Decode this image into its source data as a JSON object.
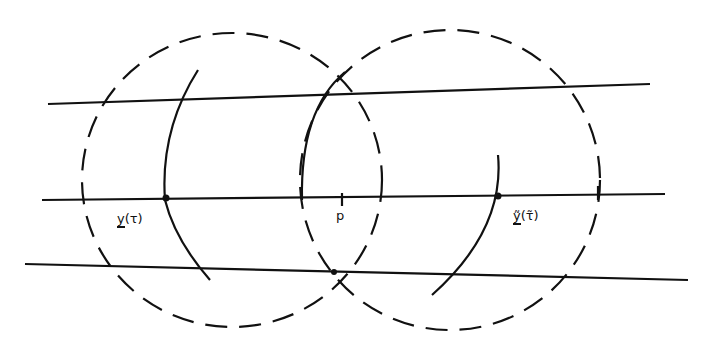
{
  "labels": {
    "y_tau": {
      "base": "y",
      "arg": "(τ)"
    },
    "p": "p",
    "y_tilde": {
      "base": "ỹ",
      "arg": "(τ̃)"
    }
  },
  "colors": {
    "stroke": "#111111",
    "background": "#ffffff"
  }
}
